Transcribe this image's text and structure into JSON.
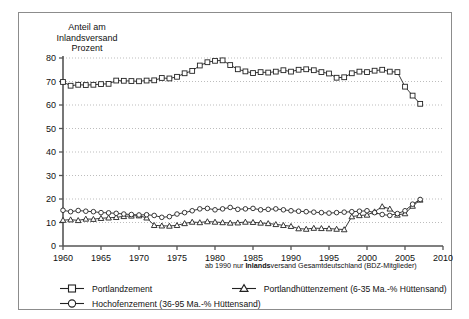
{
  "chart_data": {
    "type": "line",
    "title": "",
    "ylabel": "Anteil am Inlandsversand Prozent",
    "xlabel": "",
    "xlim": [
      1960,
      2010
    ],
    "ylim": [
      0,
      80
    ],
    "grid": true,
    "legend_position": "bottom",
    "yticks": [
      0,
      10,
      20,
      30,
      40,
      50,
      60,
      70,
      80
    ],
    "xticks": [
      1960,
      1965,
      1970,
      1975,
      1980,
      1985,
      1990,
      1995,
      2000,
      2005,
      2010
    ],
    "x": [
      1960,
      1961,
      1962,
      1963,
      1964,
      1965,
      1966,
      1967,
      1968,
      1969,
      1970,
      1971,
      1972,
      1973,
      1974,
      1975,
      1976,
      1977,
      1978,
      1979,
      1980,
      1981,
      1982,
      1983,
      1984,
      1985,
      1986,
      1987,
      1988,
      1989,
      1990,
      1991,
      1992,
      1993,
      1994,
      1995,
      1996,
      1997,
      1998,
      1999,
      2000,
      2001,
      2002,
      2003,
      2004,
      2005,
      2006,
      2007
    ],
    "series": [
      {
        "name": "Portlandzement",
        "marker": "square",
        "values": [
          69.8,
          68.2,
          68.6,
          68.5,
          68.6,
          68.9,
          69.0,
          70.4,
          70.3,
          70.2,
          70.1,
          70.4,
          70.5,
          71.5,
          71.3,
          72.0,
          73.5,
          74.5,
          76.8,
          78.2,
          78.8,
          79.0,
          77.0,
          75.2,
          74.3,
          73.6,
          74.0,
          73.8,
          74.2,
          74.8,
          74.2,
          75.0,
          75.2,
          74.8,
          74.0,
          73.4,
          71.6,
          71.8,
          73.5,
          74.2,
          74.0,
          74.6,
          75.0,
          74.2,
          74.0,
          67.8,
          64.0,
          60.5
        ]
      },
      {
        "name": "Portlandhüttenzement (6-35 Ma.-% Hüttensand)",
        "marker": "triangle",
        "values": [
          11.0,
          11.2,
          10.9,
          11.5,
          11.4,
          11.8,
          12.0,
          12.2,
          12.6,
          12.8,
          12.9,
          12.0,
          8.8,
          8.6,
          8.5,
          8.8,
          9.6,
          10.2,
          10.0,
          10.4,
          10.2,
          10.0,
          9.8,
          9.9,
          10.2,
          10.1,
          9.8,
          9.6,
          9.2,
          8.8,
          8.4,
          7.4,
          7.2,
          7.6,
          7.5,
          7.4,
          7.2,
          7.0,
          12.5,
          13.0,
          13.2,
          14.6,
          16.8,
          15.8,
          13.2,
          13.8,
          17.0,
          19.6
        ]
      },
      {
        "name": "Hochofenzement (36-95 Ma.-% Hüttensand)",
        "marker": "circle",
        "values": [
          15.2,
          14.6,
          15.1,
          14.8,
          14.6,
          14.2,
          14.1,
          13.9,
          13.6,
          13.4,
          13.2,
          13.3,
          13.0,
          12.2,
          12.5,
          13.6,
          14.2,
          15.0,
          15.8,
          16.0,
          15.4,
          15.8,
          16.4,
          15.6,
          15.8,
          16.0,
          15.4,
          15.6,
          15.8,
          15.4,
          15.0,
          14.8,
          14.6,
          14.4,
          14.2,
          14.0,
          14.2,
          14.4,
          14.6,
          14.8,
          15.0,
          14.2,
          13.4,
          13.0,
          13.8,
          15.0,
          17.8,
          19.8
        ]
      }
    ]
  },
  "footnote": {
    "prefix": "ab 1990 nur ",
    "bold": "Inlands",
    "suffix": "versand Gesamtdeutschland (BDZ-Mitglieder)"
  },
  "axis_title": "Anteil am\nInlandsversand\nProzent",
  "legend": {
    "items": [
      {
        "label": "Portlandzement",
        "marker": "square"
      },
      {
        "label": "Portlandhüttenzement (6-35 Ma.-% Hüttensand)",
        "marker": "triangle"
      },
      {
        "label": "Hochofenzement (36-95 Ma.-% Hüttensand)",
        "marker": "circle"
      }
    ]
  },
  "colors": {
    "line": "#222222",
    "grid": "#b5b5b5",
    "axis": "#555555",
    "border": "#8c8c8c"
  }
}
